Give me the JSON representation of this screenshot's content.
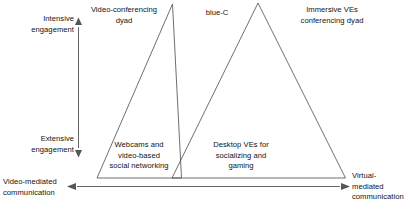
{
  "diagram": {
    "background_color": "#ffffff",
    "line_color": "#555555",
    "text_color": "#111111",
    "axes": {
      "vertical": {
        "name": "engagement-axis",
        "top_label": "Intensive\nengagement",
        "bottom_label": "Extensive\nengagement",
        "arrowheads": "both"
      },
      "horizontal": {
        "name": "mediation-axis",
        "left_label": "Video-mediated\ncommunication",
        "right_label": "Virtual-\nmediated\ncommunication",
        "arrowheads": "both"
      }
    },
    "triangles": [
      {
        "name": "video-mediated-triangle",
        "apex_label": "Video-conferencing\ndyad",
        "base_label": "Webcams and\nvideo-based\nsocial networking"
      },
      {
        "name": "virtual-mediated-triangle",
        "apex_label": "Immersive VEs\nconferencing dyad",
        "base_label": "Desktop VEs for\nsocializing and\ngaming"
      }
    ],
    "overlap_label": "blue-C"
  }
}
